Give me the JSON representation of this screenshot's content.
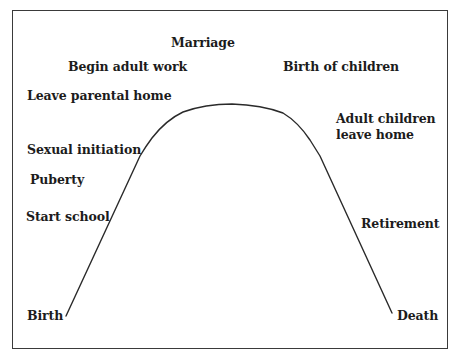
{
  "diagram": {
    "type": "life-course-arc",
    "frame_color": "#3a3a3a",
    "curve_color": "#2a2a2a",
    "text_color": "#1c1c1c",
    "background": "#ffffff",
    "left_endpoint": "Birth",
    "right_endpoint": "Death",
    "peak_label": "Marriage",
    "labels": {
      "marriage": "Marriage",
      "begin_adult_work": "Begin adult work",
      "birth_of_children": "Birth of children",
      "leave_parental_home": "Leave parental home",
      "adult_children_line1": "Adult children",
      "adult_children_line2": "leave home",
      "sexual_initiation": "Sexual initiation",
      "puberty": "Puberty",
      "start_school": "Start school",
      "retirement": "Retirement",
      "birth": "Birth",
      "death": "Death"
    },
    "ascending_events": [
      "Birth",
      "Start school",
      "Puberty",
      "Sexual initiation",
      "Leave parental home",
      "Begin adult work",
      "Marriage"
    ],
    "descending_events": [
      "Birth of children",
      "Adult children leave home",
      "Retirement",
      "Death"
    ]
  }
}
